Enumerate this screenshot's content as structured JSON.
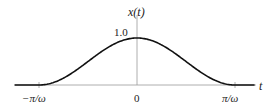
{
  "chart_data": {
    "type": "line",
    "title": "",
    "xlabel": "t",
    "ylabel": "x(t)",
    "function": "x(t) = 0.5*(1 + cos(omega*t)) for |t| <= pi/omega, 0 otherwise",
    "x_ticks": [
      "-π/ω",
      "0",
      "π/ω"
    ],
    "x_tick_values": [
      -1,
      0,
      1
    ],
    "x_units": "π/ω",
    "y_ticks": [
      "1.0"
    ],
    "y_tick_values": [
      1.0
    ],
    "xlim": [
      -1.25,
      1.2
    ],
    "ylim": [
      0,
      1.0
    ],
    "grid": false,
    "legend": null,
    "series": [
      {
        "name": "x(t)",
        "x": [
          -1.25,
          -1.0,
          -0.75,
          -0.5,
          -0.25,
          0.0,
          0.25,
          0.5,
          0.75,
          1.0,
          1.2
        ],
        "values": [
          0.0,
          0.0,
          0.146,
          0.5,
          0.854,
          1.0,
          0.854,
          0.5,
          0.146,
          0.0,
          0.0
        ]
      }
    ],
    "colors": {
      "curve": "#111111",
      "axis": "#999999",
      "text": "#222222"
    }
  },
  "labels": {
    "y_axis": "x(t)",
    "y_peak": "1.0",
    "x_axis": "t",
    "tick_left": "−π/ω",
    "tick_zero": "0",
    "tick_right": "π/ω"
  }
}
